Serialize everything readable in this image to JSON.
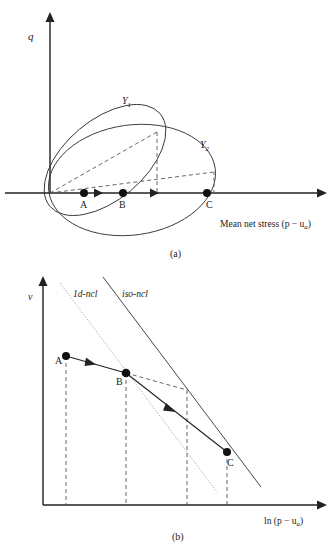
{
  "figure_a": {
    "y_axis_label": "q",
    "x_axis_label": "Mean net stress (p − u",
    "x_axis_sub": "a",
    "x_axis_close": ")",
    "caption": "(a)",
    "yield_surfaces": [
      {
        "label": "Y",
        "sub": "1"
      },
      {
        "label": "Y",
        "sub": "2"
      }
    ],
    "points": [
      {
        "label": "A"
      },
      {
        "label": "B"
      },
      {
        "label": "C"
      }
    ]
  },
  "figure_b": {
    "y_axis_label": "v",
    "x_axis_label": "ln (p − u",
    "x_axis_sub": "a",
    "x_axis_close": ")",
    "caption": "(b)",
    "lines": [
      {
        "label": "1d-ncl",
        "style": "dotted-gray"
      },
      {
        "label": "iso-ncl",
        "style": "solid"
      }
    ],
    "points": [
      {
        "label": "A"
      },
      {
        "label": "B"
      },
      {
        "label": "C"
      }
    ]
  },
  "colors": {
    "ink": "#222222",
    "dotted": "#aaaaaa",
    "dashed": "#555555"
  }
}
